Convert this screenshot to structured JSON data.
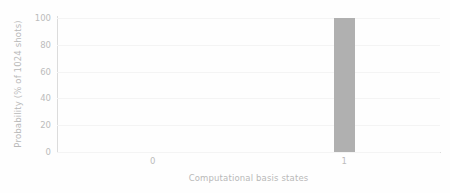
{
  "chart_data": {
    "type": "bar",
    "title": "",
    "subtitle": "",
    "xlabel": "Computational basis states",
    "ylabel": "Probability (% of 1024 shots)",
    "categories": [
      "0",
      "1"
    ],
    "values": [
      0,
      100
    ],
    "series": [
      {
        "name": "Probability",
        "values": [
          0,
          100
        ]
      }
    ],
    "yticks": [
      0,
      20,
      40,
      60,
      80,
      100
    ],
    "ytick_labels": [
      "0",
      "20",
      "40",
      "60",
      "80",
      "100"
    ],
    "xtick_labels": [
      "0",
      "1"
    ],
    "ylim": [
      0,
      100
    ],
    "grid": true,
    "grid_axis": "y",
    "legend": false,
    "legend_position": "none",
    "bar_color": "#b0b0b0",
    "grid_color": "#f4f4f4",
    "spine_color": "#dcdcdc",
    "text_color": "#bcbcbc",
    "background_color": "#fefefe"
  }
}
